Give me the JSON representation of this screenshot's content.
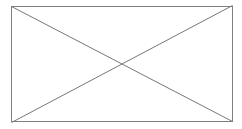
{
  "graphic": {
    "kind": "image-placeholder",
    "alt_text": "",
    "canvas": {
      "width": 242,
      "height": 129,
      "background_color": "#ffffff"
    },
    "frame": {
      "name": "placeholder-frame",
      "x": 11,
      "y": 6,
      "width": 222,
      "height": 116,
      "stroke_color": "#808080",
      "stroke_width": 1,
      "fill_color": "#ffffff"
    },
    "diagonals": [
      {
        "name": "diagonal-top-left-to-bottom-right",
        "x1": 11,
        "y1": 6,
        "x2": 233,
        "y2": 122,
        "stroke_color": "#777777",
        "stroke_width": 1
      },
      {
        "name": "diagonal-bottom-left-to-top-right",
        "x1": 11,
        "y1": 122,
        "x2": 233,
        "y2": 6,
        "stroke_color": "#777777",
        "stroke_width": 1
      }
    ],
    "crossing_point": {
      "x": 122,
      "y": 64
    }
  }
}
